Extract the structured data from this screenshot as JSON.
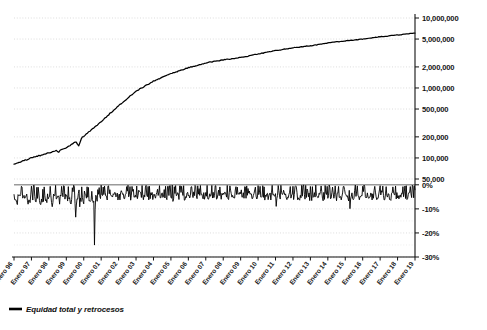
{
  "chart_data": {
    "type": "line",
    "title": "",
    "subtitle": "",
    "xlabel": "",
    "ylabel": "",
    "grid": true,
    "legend_position": "bottom-left",
    "panels": [
      {
        "name": "equity",
        "scale": "log",
        "ylim": [
          50000,
          10000000
        ],
        "ytick_labels": [
          "10,000,000",
          "5,000,000",
          "2,000,000",
          "1,000,000",
          "500,000",
          "200,000",
          "100,000",
          "50,000"
        ],
        "ytick_values": [
          10000000,
          5000000,
          2000000,
          1000000,
          500000,
          200000,
          100000,
          50000
        ],
        "series": [
          {
            "name": "Equidad total",
            "color": "#000000",
            "x": [
              "Enero 96",
              "Enero 97",
              "Enero 98",
              "Enero 99",
              "Enero 00",
              "Enero 01",
              "Enero 02",
              "Enero 03",
              "Enero 04",
              "Enero 05",
              "Enero 06",
              "Enero 07",
              "Enero 08",
              "Enero 09",
              "Enero 10",
              "Enero 11",
              "Enero 12",
              "Enero 13",
              "Enero 14",
              "Enero 15",
              "Enero 16",
              "Enero 17",
              "Enero 18",
              "Enero 19"
            ],
            "values": [
              82000,
              100000,
              118000,
              140000,
              205000,
              330000,
              560000,
              900000,
              1250000,
              1600000,
              1950000,
              2280000,
              2520000,
              2720000,
              3050000,
              3420000,
              3750000,
              4000000,
              4400000,
              4700000,
              5000000,
              5400000,
              5700000,
              6100000
            ]
          }
        ]
      },
      {
        "name": "retrocesos",
        "scale": "linear",
        "ylim": [
          -30,
          2
        ],
        "ytick_labels": [
          "0%",
          "-10%",
          "-20%",
          "-30%"
        ],
        "ytick_values": [
          0,
          -10,
          -20,
          -30
        ],
        "series": [
          {
            "name": "Retrocesos",
            "color": "#000000",
            "x": [
              "Enero 96",
              "Enero 97",
              "Enero 98",
              "Enero 99",
              "Enero 00",
              "Enero 01",
              "Enero 02",
              "Enero 03",
              "Enero 04",
              "Enero 05",
              "Enero 06",
              "Enero 07",
              "Enero 08",
              "Enero 09",
              "Enero 10",
              "Enero 11",
              "Enero 12",
              "Enero 13",
              "Enero 14",
              "Enero 15",
              "Enero 16",
              "Enero 17",
              "Enero 18",
              "Enero 19"
            ],
            "max_drawdown_pct": -28,
            "typical_range_pct": [
              -8,
              0
            ]
          }
        ]
      }
    ],
    "xtick_labels": [
      "Enero 96",
      "Enero 97",
      "Enero 98",
      "Enero 99",
      "Enero 00",
      "Enero 01",
      "Enero 02",
      "Enero 03",
      "Enero 04",
      "Enero 05",
      "Enero 06",
      "Enero 07",
      "Enero 08",
      "Enero 09",
      "Enero 10",
      "Enero 11",
      "Enero 12",
      "Enero 13",
      "Enero 14",
      "Enero 15",
      "Enero 16",
      "Enero 17",
      "Enero 18",
      "Enero 19"
    ],
    "legend": [
      {
        "label": "Equidad total y retrocesos",
        "color": "#000000"
      }
    ]
  },
  "colors": {
    "series": "#000000",
    "grid": "#cfcfcf",
    "zero_line": "#9a9a9a",
    "axis": "#111111",
    "background": "#ffffff"
  }
}
